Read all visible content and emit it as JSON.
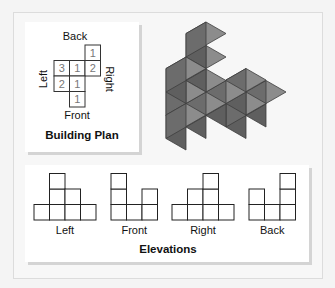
{
  "building_plan": {
    "title": "Building Plan",
    "labels": {
      "back": "Back",
      "front": "Front",
      "left": "Left",
      "right": "Right"
    },
    "grid": [
      [
        null,
        null,
        1
      ],
      [
        3,
        1,
        2
      ],
      [
        2,
        1,
        null
      ],
      [
        null,
        1,
        null
      ]
    ]
  },
  "elevations": {
    "title": "Elevations",
    "views": [
      {
        "label": "Left",
        "columns": [
          1,
          3,
          2,
          1
        ]
      },
      {
        "label": "Front",
        "columns": [
          3,
          1,
          2
        ]
      },
      {
        "label": "Right",
        "columns": [
          1,
          2,
          3,
          1
        ]
      },
      {
        "label": "Back",
        "columns": [
          2,
          1,
          3
        ]
      }
    ]
  },
  "colors": {
    "cube_top": "#8c8c8c",
    "cube_left": "#6c6c6c",
    "cube_right": "#5f5f5f",
    "cube_edge": "#3e3e3e",
    "plan_numbers": "#777777",
    "grid_line": "#333333"
  }
}
